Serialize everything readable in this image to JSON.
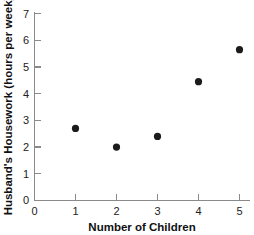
{
  "chart_data": {
    "type": "scatter",
    "title": "",
    "xlabel": "Number of Children",
    "ylabel": "Husband's Housework (hours per week)",
    "x": [
      1,
      2,
      3,
      4,
      5
    ],
    "values": [
      2.7,
      2.0,
      2.4,
      4.45,
      5.65
    ],
    "points": [
      {
        "x": 1,
        "y": 2.7
      },
      {
        "x": 2,
        "y": 2.0
      },
      {
        "x": 3,
        "y": 2.4
      },
      {
        "x": 4,
        "y": 4.45
      },
      {
        "x": 5,
        "y": 5.65
      }
    ],
    "xlim": [
      0,
      5.4
    ],
    "ylim": [
      0,
      7
    ],
    "xticks": [
      "0",
      "1",
      "2",
      "3",
      "4",
      "5"
    ],
    "yticks": [
      "0",
      "1",
      "2",
      "3",
      "4",
      "5",
      "6",
      "7"
    ],
    "grid": false,
    "legend": null,
    "marker_color": "#1b1b1b",
    "axis_color": "#8a8a8a"
  },
  "axes": {
    "x_axis_name": "x-axis",
    "y_axis_name": "y-axis"
  }
}
